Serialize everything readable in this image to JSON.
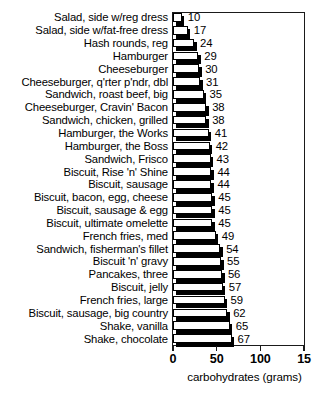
{
  "chart_data": {
    "type": "bar",
    "orientation": "horizontal",
    "title": "",
    "xlabel": "carbohydrates (grams)",
    "ylabel": "",
    "xlim": [
      0,
      150
    ],
    "xticks": [
      0,
      50,
      100,
      150
    ],
    "xticklabels": [
      "0",
      "50",
      "100",
      "15"
    ],
    "grid": false,
    "legend": null,
    "value_labels": true,
    "categories": [
      "Salad, side w/reg dress",
      "Salad, side w/fat-free dress",
      "Hash rounds, reg",
      "Hamburger",
      "Cheeseburger",
      "Cheeseburger, q'rter p'ndr, dbl",
      "Sandwich, roast beef, big",
      "Cheeseburger, Cravin' Bacon",
      "Sandwich, chicken, grilled",
      "Hamburger, the Works",
      "Hamburger, the Boss",
      "Sandwich, Frisco",
      "Biscuit, Rise 'n' Shine",
      "Biscuit, sausage",
      "Biscuit, bacon, egg, cheese",
      "Biscuit, sausage & egg",
      "Biscuit, ultimate omelette",
      "French fries, med",
      "Sandwich, fisherman's fillet",
      "Biscuit 'n' gravy",
      "Pancakes, three",
      "Biscuit, jelly",
      "French fries, large",
      "Biscuit, sausage, big country",
      "Shake, vanilla",
      "Shake, chocolate"
    ],
    "values": [
      10,
      17,
      24,
      29,
      30,
      31,
      35,
      38,
      38,
      41,
      42,
      43,
      44,
      44,
      45,
      45,
      45,
      49,
      54,
      55,
      56,
      57,
      59,
      62,
      65,
      67
    ],
    "colors": {
      "bar_face": "#ffffff",
      "bar_edge": "#000000",
      "bar_shadow": "#000000",
      "frame": "#1a1a1a",
      "text": "#000000",
      "background": "#ffffff"
    }
  }
}
